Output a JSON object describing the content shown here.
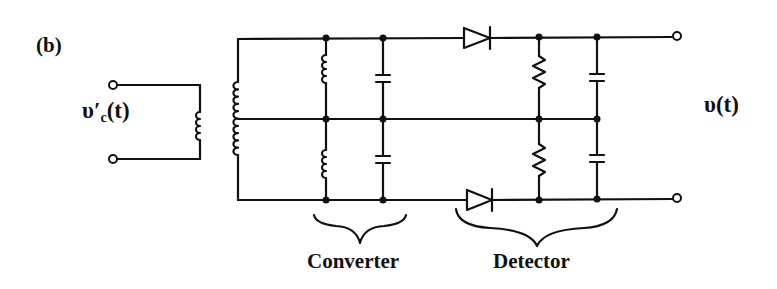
{
  "figure": {
    "panel_label": "(b)",
    "input_label": {
      "symbol": "υ′",
      "subscript": "c",
      "suffix": "(t)"
    },
    "output_label": "υ(t)",
    "sections": [
      {
        "name": "converter",
        "label": "Converter"
      },
      {
        "name": "detector",
        "label": "Detector"
      }
    ],
    "components": {
      "transformer": {
        "primary_coil": 1,
        "secondary_coil_center_tapped": 1
      },
      "converter": {
        "inductors": 2,
        "capacitors": 2
      },
      "detector": {
        "diodes": 2,
        "resistors": 2,
        "capacitors": 2
      }
    },
    "colors": {
      "ink": "#111111",
      "background": "#ffffff"
    }
  }
}
